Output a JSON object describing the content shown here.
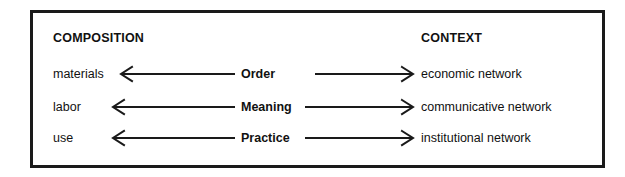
{
  "diagram": {
    "columns": {
      "left_heading": "COMPOSITION",
      "right_heading": "CONTEXT"
    },
    "rows": [
      {
        "source": "materials",
        "relation": "Order",
        "target": "economic network",
        "left_arrow": "arrow-left",
        "right_arrow": "arrow-right"
      },
      {
        "source": "labor",
        "relation": "Meaning",
        "target": "communicative network",
        "left_arrow": "arrow-left",
        "right_arrow": "arrow-right"
      },
      {
        "source": "use",
        "relation": "Practice",
        "target": "institutional network",
        "left_arrow": "arrow-left",
        "right_arrow": "arrow-right"
      }
    ],
    "colors": {
      "stroke": "#1a1a1a",
      "text": "#111111",
      "background": "#ffffff",
      "border": "#1a1a1a"
    }
  }
}
